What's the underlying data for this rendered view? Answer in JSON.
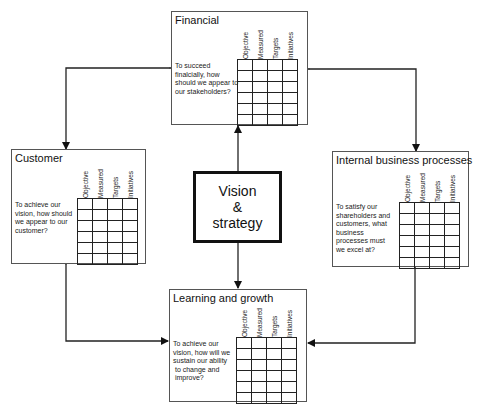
{
  "diagram": {
    "center": {
      "lines": [
        "Vision",
        "&",
        "strategy"
      ]
    },
    "column_headers": [
      "Objective",
      "Measured",
      "Targets",
      "Initiatives"
    ],
    "perspectives": {
      "financial": {
        "title": "Financial",
        "question": [
          "To succeed",
          "finalcially, how",
          "should we appear to",
          "our stakeholders?"
        ]
      },
      "customer": {
        "title": "Customer",
        "question": [
          "To achieve our",
          "vision, how should",
          "we appear to our",
          "customer?"
        ]
      },
      "internal": {
        "title": "Internal business processes",
        "question": [
          "To satisfy our",
          "shareholders and",
          "customers, what",
          "business",
          "processes must",
          "we excel at?"
        ]
      },
      "learning": {
        "title": "Learning and growth",
        "question": [
          "To achieve our",
          "vision, how will we",
          "sustain our ability",
          " to change and",
          " improve?"
        ]
      }
    },
    "grid_rows": 6,
    "grid_cols": 4
  }
}
